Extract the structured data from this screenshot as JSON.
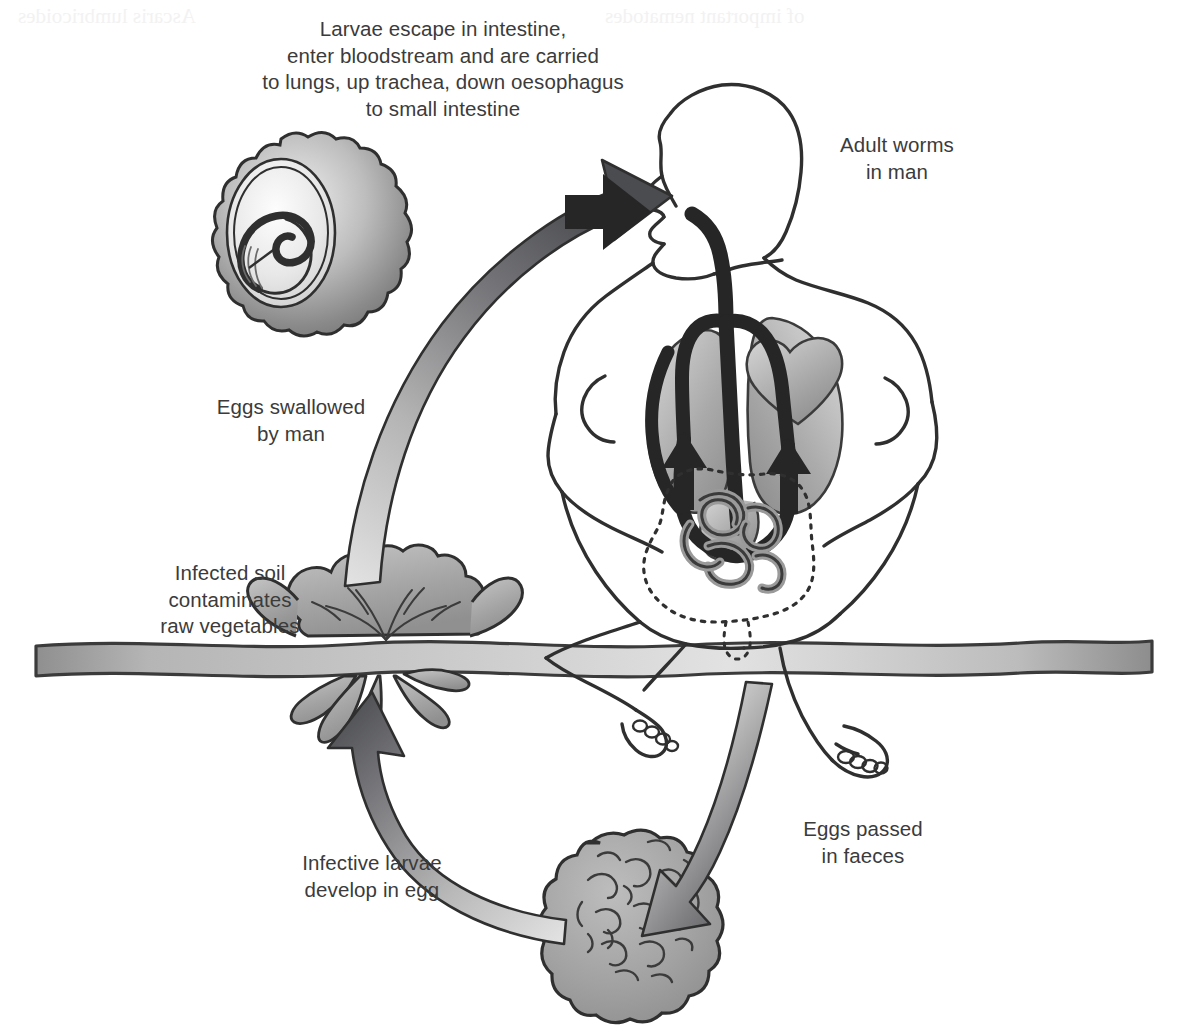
{
  "diagram": {
    "type": "life-cycle-diagram",
    "background_color": "#ffffff",
    "ink_color": "#3b3b3b",
    "fill_grey": "#9a9a9a",
    "fill_grey_light": "#c9c9c9",
    "fill_grey_dark": "#55565a"
  },
  "labels": {
    "larvae_escape": "Larvae escape in intestine,\nenter bloodstream and are carried\nto lungs, up trachea, down oesophagus\nto small intestine",
    "adult_worms": "Adult worms\nin man",
    "eggs_swallowed": "Eggs swallowed\nby man",
    "infected_soil": "Infected soil\ncontaminates\nraw vegetables",
    "infective_larvae": "Infective larvae\ndevelop in egg",
    "eggs_passed": "Eggs passed\nin faeces"
  },
  "bleed_through": {
    "line1": "of important nematodes",
    "line2": "Ascaris lumbricoides"
  },
  "elements": {
    "embryonated_egg": "embryonated-egg-illustration",
    "larvated_egg": "larvated-egg-illustration",
    "lettuce": "lettuce-plant-illustration",
    "human_figure": "seated-human-figure",
    "lungs": "lungs",
    "heart": "heart",
    "intestine_worms": "coiled-adult-worms",
    "soil_line": "soil-ground-band",
    "arrow_up_left": "arrow-eggs-to-mouth",
    "arrow_down_right": "arrow-faeces-to-egg",
    "arrow_egg_to_soil": "arrow-egg-to-vegetables",
    "arrow_into_mouth": "arrow-into-mouth",
    "migration_path": "larvae-migration-path"
  }
}
